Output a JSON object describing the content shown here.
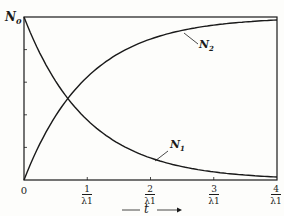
{
  "chart_data": {
    "type": "line",
    "title": "",
    "xlabel": "t",
    "ylabel": "",
    "y_top_label": "N0",
    "xlim": [
      0,
      4
    ],
    "ylim": [
      0,
      1
    ],
    "x_ticks": [
      {
        "value": 0,
        "label": "0"
      },
      {
        "value": 1,
        "num": "1",
        "den": "λ1"
      },
      {
        "value": 2,
        "num": "2",
        "den": "λ1"
      },
      {
        "value": 3,
        "num": "3",
        "den": "λ1"
      },
      {
        "value": 4,
        "num": "4",
        "den": "λ1"
      }
    ],
    "y_ticks": [
      0,
      0.2,
      0.4,
      0.6,
      0.8,
      1.0
    ],
    "grid": false,
    "series": [
      {
        "name": "N1",
        "label": "N1",
        "formula": "N0*exp(-λ1 t)",
        "x": [
          0,
          0.5,
          1,
          1.5,
          2,
          2.5,
          3,
          3.5,
          4
        ],
        "values": [
          1.0,
          0.607,
          0.368,
          0.223,
          0.135,
          0.082,
          0.05,
          0.03,
          0.018
        ]
      },
      {
        "name": "N2",
        "label": "N2",
        "formula": "N0*(1-exp(-λ1 t))",
        "x": [
          0,
          0.5,
          1,
          1.5,
          2,
          2.5,
          3,
          3.5,
          4
        ],
        "values": [
          0.0,
          0.393,
          0.632,
          0.777,
          0.865,
          0.918,
          0.95,
          0.97,
          0.982
        ]
      }
    ]
  },
  "labels": {
    "n0": "N",
    "n0_sub": "0",
    "n1": "N",
    "n1_sub": "1",
    "n2": "N",
    "n2_sub": "2",
    "origin": "0",
    "t": "t"
  }
}
